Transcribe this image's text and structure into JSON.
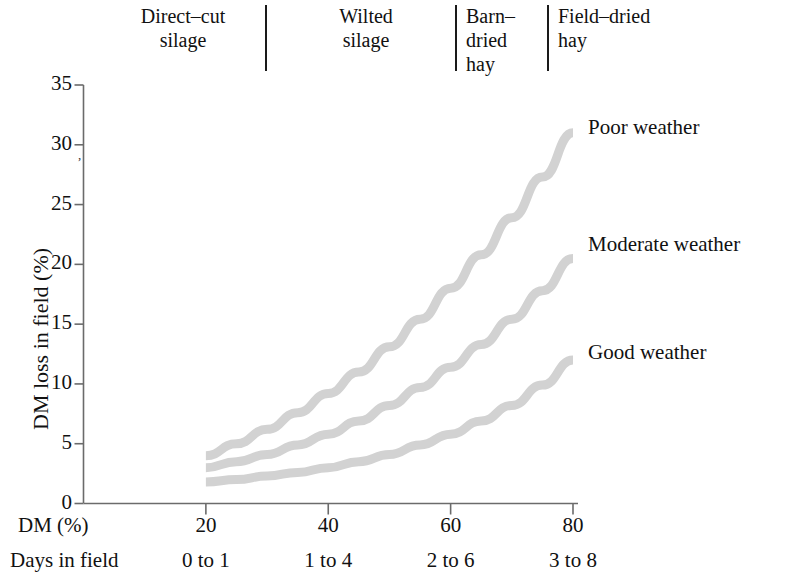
{
  "categories_band": {
    "items": [
      {
        "label": "Direct–cut\nsilage",
        "x": 108,
        "y": 4,
        "align": "center",
        "width": 150
      },
      {
        "label": "Wilted\nsilage",
        "x": 296,
        "y": 4,
        "align": "center",
        "width": 140
      },
      {
        "label": "Barn–\ndried\nhay",
        "x": 466,
        "y": 4,
        "align": "left",
        "width": 80
      },
      {
        "label": "Field–dried\nhay",
        "x": 558,
        "y": 4,
        "align": "left",
        "width": 160
      }
    ],
    "separators": [
      {
        "x": 265,
        "y": 5,
        "height": 66
      },
      {
        "x": 455,
        "y": 5,
        "height": 66
      },
      {
        "x": 547,
        "y": 5,
        "height": 66
      }
    ]
  },
  "axes": {
    "y_title": "DM loss in field (%)",
    "y_ticks": [
      "35",
      "30",
      "25",
      "20",
      "15",
      "10",
      "5",
      "0"
    ],
    "x_title": "DM (%)",
    "x_ticks": [
      "20",
      "40",
      "60",
      "80"
    ],
    "days_title": "Days in field",
    "days_values": [
      "0 to 1",
      "1 to 4",
      "2 to 6",
      "3 to 8"
    ]
  },
  "series_labels": [
    {
      "text": "Poor weather",
      "x": 588,
      "y": 115
    },
    {
      "text": "Moderate weather",
      "x": 588,
      "y": 232
    },
    {
      "text": "Good weather",
      "x": 588,
      "y": 340
    }
  ],
  "colors": {
    "curve": "#d2d2d2",
    "axis": "#6b6b6b",
    "text": "#111111",
    "separator": "#1a1a1a",
    "background": "#ffffff"
  },
  "chart_data": {
    "type": "line",
    "title": "",
    "xlabel": "DM (%)",
    "ylabel": "DM loss in field (%)",
    "xlim": [
      0,
      80
    ],
    "ylim": [
      0,
      35
    ],
    "xticks": [
      20,
      40,
      60,
      80
    ],
    "yticks": [
      0,
      5,
      10,
      15,
      20,
      25,
      30,
      35
    ],
    "grid": false,
    "legend": "inline-right-of-curve-ends",
    "secondary_axis": {
      "label": "Days in field",
      "ticklabels": [
        "0 to 1",
        "1 to 4",
        "2 to 6",
        "3 to 8"
      ],
      "at_x": [
        20,
        40,
        60,
        80
      ]
    },
    "category_bands": [
      {
        "label": "Direct-cut silage",
        "x_range": [
          0,
          30
        ]
      },
      {
        "label": "Wilted silage",
        "x_range": [
          30,
          60
        ]
      },
      {
        "label": "Barn-dried hay",
        "x_range": [
          60,
          75
        ]
      },
      {
        "label": "Field-dried hay",
        "x_range": [
          75,
          80
        ]
      }
    ],
    "x": [
      20,
      25,
      30,
      35,
      40,
      45,
      50,
      55,
      60,
      65,
      70,
      75,
      80
    ],
    "series": [
      {
        "name": "Poor weather",
        "values": [
          4.0,
          5.0,
          6.2,
          7.6,
          9.2,
          11.0,
          13.1,
          15.4,
          18.0,
          20.8,
          23.9,
          27.3,
          31.0
        ]
      },
      {
        "name": "Moderate weather",
        "values": [
          3.0,
          3.5,
          4.1,
          4.9,
          5.8,
          6.9,
          8.2,
          9.7,
          11.4,
          13.3,
          15.4,
          17.8,
          20.5
        ]
      },
      {
        "name": "Good weather",
        "values": [
          1.8,
          2.0,
          2.3,
          2.6,
          3.0,
          3.5,
          4.1,
          4.9,
          5.8,
          6.9,
          8.2,
          9.9,
          12.0
        ]
      }
    ]
  }
}
